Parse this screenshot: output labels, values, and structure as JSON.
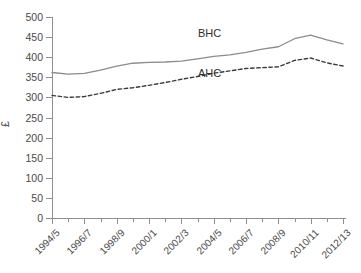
{
  "chart_data": {
    "type": "line",
    "title": "",
    "xlabel": "",
    "ylabel": "£",
    "ylim": [
      0,
      500
    ],
    "yticks": [
      0,
      50,
      100,
      150,
      200,
      250,
      300,
      350,
      400,
      450,
      500
    ],
    "grid": false,
    "legend_position": "inline-annotation",
    "x": [
      "1994/5",
      "1995/6",
      "1996/7",
      "1997/8",
      "1998/9",
      "1999/0",
      "2000/1",
      "2001/2",
      "2002/3",
      "2003/4",
      "2004/5",
      "2005/6",
      "2006/7",
      "2007/8",
      "2008/9",
      "2009/10",
      "2010/11",
      "2011/12",
      "2012/13"
    ],
    "xtick_labels": [
      "1994/5",
      "1996/7",
      "1998/9",
      "2000/1",
      "2002/3",
      "2004/5",
      "2006/7",
      "2008/9",
      "2010/11",
      "2012/13"
    ],
    "series": [
      {
        "name": "BHC",
        "style": "solid",
        "color": "#8c8c8c",
        "values": [
          362,
          358,
          360,
          368,
          378,
          385,
          387,
          388,
          390,
          396,
          402,
          406,
          412,
          420,
          426,
          446,
          455,
          443,
          433
        ]
      },
      {
        "name": "AHC",
        "style": "dashed",
        "color": "#3a3a3a",
        "values": [
          305,
          300,
          302,
          310,
          320,
          324,
          330,
          337,
          345,
          352,
          360,
          366,
          372,
          374,
          376,
          392,
          398,
          386,
          378
        ]
      }
    ],
    "annotations": [
      {
        "text": "BHC",
        "x_px": 198,
        "y_px": 27
      },
      {
        "text": "AHC",
        "x_px": 198,
        "y_px": 67
      }
    ]
  }
}
